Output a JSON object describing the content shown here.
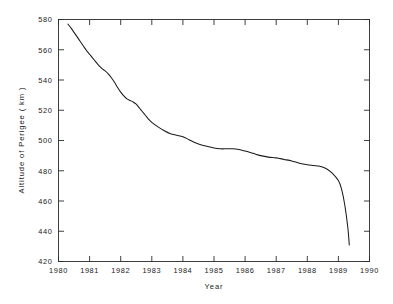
{
  "chart_data": {
    "type": "line",
    "title": "",
    "xlabel": "Year",
    "ylabel": "Altitude of Perigee ( km )",
    "xlim": [
      1980,
      1990
    ],
    "ylim": [
      420,
      580
    ],
    "grid": false,
    "legend": "none",
    "xticks": [
      1980,
      1981,
      1982,
      1983,
      1984,
      1985,
      1986,
      1987,
      1988,
      1989,
      1990
    ],
    "xtick_labels": [
      "1980",
      "1981",
      "1982",
      "1983",
      "1984",
      "1985",
      "1986",
      "1987",
      "1988",
      "1989",
      "1990"
    ],
    "yticks": [
      420,
      440,
      460,
      480,
      500,
      520,
      540,
      560,
      580
    ],
    "ytick_labels": [
      "420",
      "440",
      "460",
      "480",
      "500",
      "520",
      "540",
      "560",
      "580"
    ],
    "series": [
      {
        "name": "Altitude of Perigee",
        "color": "#1b1b1b",
        "x": [
          1980.3,
          1980.4,
          1980.5,
          1980.6,
          1980.7,
          1980.8,
          1980.9,
          1981.0,
          1981.1,
          1981.2,
          1981.3,
          1981.4,
          1981.5,
          1981.6,
          1981.7,
          1981.8,
          1981.9,
          1982.0,
          1982.1,
          1982.2,
          1982.3,
          1982.4,
          1982.5,
          1982.6,
          1982.7,
          1982.8,
          1982.9,
          1983.0,
          1983.2,
          1983.4,
          1983.6,
          1983.8,
          1984.0,
          1984.2,
          1984.4,
          1984.6,
          1984.8,
          1985.0,
          1985.2,
          1985.4,
          1985.6,
          1985.8,
          1986.0,
          1986.25,
          1986.5,
          1986.75,
          1987.0,
          1987.25,
          1987.5,
          1987.75,
          1988.0,
          1988.2,
          1988.4,
          1988.6,
          1988.8,
          1989.0,
          1989.1,
          1989.2,
          1989.3,
          1989.35
        ],
        "y": [
          577.0,
          574.5,
          571.5,
          568.5,
          565.5,
          562.5,
          559.5,
          557.0,
          554.5,
          552.0,
          549.5,
          547.5,
          546.0,
          544.0,
          541.5,
          538.5,
          535.0,
          532.0,
          529.5,
          527.5,
          526.5,
          525.5,
          524.0,
          521.5,
          519.0,
          516.5,
          514.0,
          512.0,
          509.0,
          506.5,
          504.5,
          503.5,
          502.5,
          500.5,
          498.5,
          497.0,
          496.0,
          495.0,
          494.5,
          494.5,
          494.5,
          494.0,
          493.0,
          491.5,
          490.0,
          489.0,
          488.5,
          487.5,
          486.5,
          485.0,
          484.0,
          483.5,
          483.0,
          481.5,
          478.5,
          473.5,
          468.0,
          458.0,
          443.0,
          431.0
        ]
      }
    ],
    "annotations": []
  },
  "axes": {
    "y_axis_title": "Altitude of Perigee ( km )",
    "x_axis_title": "Year"
  }
}
